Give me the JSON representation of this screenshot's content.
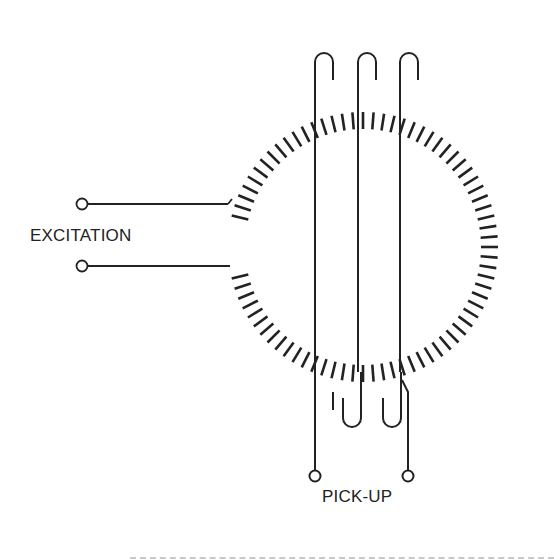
{
  "diagram": {
    "type": "fluxgate toroidal core schematic",
    "labels": {
      "excitation": "EXCITATION",
      "pickup": "PICK-UP"
    },
    "core": {
      "shape": "toroid",
      "center": [
        363,
        247
      ],
      "outer_radius": 135,
      "inner_radius": 118,
      "gap_side": "left",
      "winding": "excitation coil (hatched ticks)"
    },
    "excitation_terminals": 2,
    "pickup_turns": 3,
    "pickup_terminals": 2,
    "colors": {
      "line": "#222222",
      "background": "#ffffff",
      "divider": "#c8c8c8"
    }
  }
}
